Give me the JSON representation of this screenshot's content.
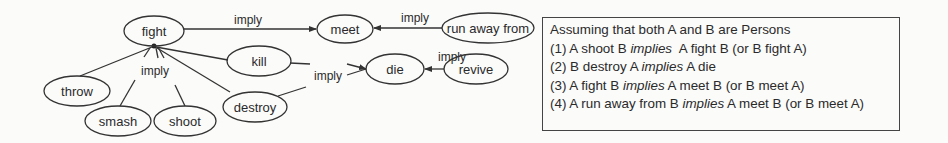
{
  "diagram": {
    "nodes": [
      {
        "id": "fight",
        "label": "fight",
        "cx": 154,
        "cy": 31,
        "rx": 30,
        "ry": 15
      },
      {
        "id": "meet",
        "label": "meet",
        "cx": 345,
        "cy": 29,
        "rx": 28,
        "ry": 14
      },
      {
        "id": "run_away_from",
        "label": "run away from",
        "cx": 488,
        "cy": 28,
        "rx": 46,
        "ry": 15
      },
      {
        "id": "kill",
        "label": "kill",
        "cx": 259,
        "cy": 61,
        "rx": 32,
        "ry": 15
      },
      {
        "id": "die",
        "label": "die",
        "cx": 395,
        "cy": 69,
        "rx": 29,
        "ry": 15
      },
      {
        "id": "revive",
        "label": "revive",
        "cx": 476,
        "cy": 69,
        "rx": 32,
        "ry": 15
      },
      {
        "id": "throw",
        "label": "throw",
        "cx": 77,
        "cy": 91,
        "rx": 33,
        "ry": 15
      },
      {
        "id": "smash",
        "label": "smash",
        "cx": 118,
        "cy": 121,
        "rx": 33,
        "ry": 15
      },
      {
        "id": "shoot",
        "label": "shoot",
        "cx": 185,
        "cy": 121,
        "rx": 31,
        "ry": 15
      },
      {
        "id": "destroy",
        "label": "destroy",
        "cx": 255,
        "cy": 107,
        "rx": 32,
        "ry": 15
      }
    ],
    "edge_labels": {
      "fight_meet": "imply",
      "runaway_meet": "imply",
      "subverbs_fight": "imply",
      "kill_destroy_die": "imply",
      "revive_die": "imply"
    }
  },
  "note": {
    "title": "Assuming that both A and B are Persons",
    "rules": [
      {
        "pre": "(1) A shoot B ",
        "verb": "implies",
        "post": "  A fight B (or B fight A)"
      },
      {
        "pre": "(2) B destroy A ",
        "verb": "implies",
        "post": " A die"
      },
      {
        "pre": "(3) A fight B ",
        "verb": "implies",
        "post": " A meet B (or B meet A)"
      },
      {
        "pre": "(4) A run away from B ",
        "verb": "implies",
        "post": " A meet B (or B meet A)"
      }
    ]
  }
}
